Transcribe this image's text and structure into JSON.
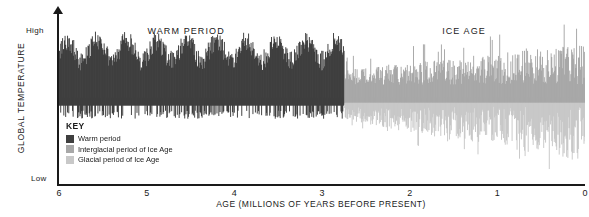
{
  "axes": {
    "y_title": "GLOBAL TEMPERATURE",
    "y_high": "High",
    "y_low": "Low",
    "x_title": "AGE (MILLIONS OF YEARS BEFORE PRESENT)",
    "x_ticks": [
      "6",
      "5",
      "4",
      "3",
      "2",
      "1",
      "0"
    ]
  },
  "annotations": [
    {
      "label": "WARM PERIOD",
      "x_value": 4.55
    },
    {
      "label": "ICE AGE",
      "x_value": 1.38
    }
  ],
  "key": {
    "title": "KEY",
    "items": [
      {
        "label": "Warm period",
        "color": "#3f3f3f"
      },
      {
        "label": "Interglacial period of Ice Age",
        "color": "#a8a8a8"
      },
      {
        "label": "Glacial period of Ice Age",
        "color": "#c8c8c8"
      }
    ]
  },
  "chart_data": {
    "type": "area",
    "title": "",
    "xlabel": "AGE (MILLIONS OF YEARS BEFORE PRESENT)",
    "ylabel": "GLOBAL TEMPERATURE",
    "xlim": [
      6,
      0
    ],
    "ylim": [
      0,
      1
    ],
    "x_reversed": true,
    "grid": false,
    "legend_position": "inside-lower-left",
    "baseline": 0.52,
    "transition_x": 2.75,
    "series": [
      {
        "name": "Warm period",
        "color": "#3f3f3f",
        "x_range": [
          6.0,
          2.75
        ],
        "description": "Dense high-frequency oscillation, amplitude mostly above baseline, band from about 0.35 to 0.95 of axis height"
      },
      {
        "name": "Ice Age oscillation",
        "color": "#a8a8a8",
        "x_range": [
          2.75,
          0.0
        ],
        "description": "Dense high-frequency oscillation with growing amplitude toward present, spikes above baseline (interglacial) and deep troughs below baseline (glacial), band from about 0.10 to 0.95"
      }
    ],
    "values_note": "Stylised paleoclimate temperature proxy curve; values read as fraction of plot height where baseline = 0.52"
  }
}
